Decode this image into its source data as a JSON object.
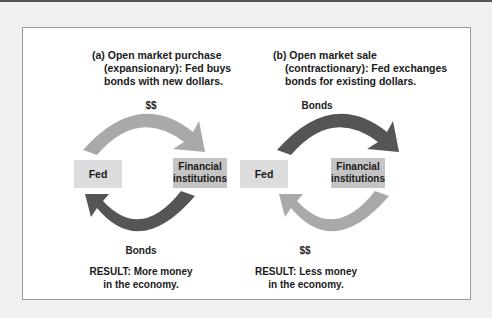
{
  "figure": {
    "panel_a": {
      "caption_line1": "(a) Open market purchase",
      "caption_line2": "(expansionary): Fed buys",
      "caption_line3": "bonds with new dollars.",
      "top_flow_label": "$$",
      "bottom_flow_label": "Bonds",
      "node_left": "Fed",
      "node_right_line1": "Financial",
      "node_right_line2": "institutions",
      "result_line1": "RESULT: More money",
      "result_line2": "in the economy.",
      "top_arrow_color": "#a9a9a9",
      "bottom_arrow_color": "#555555"
    },
    "panel_b": {
      "caption_line1": "(b) Open market sale",
      "caption_line2": "(contractionary): Fed exchanges",
      "caption_line3": "bonds for existing dollars.",
      "top_flow_label": "Bonds",
      "bottom_flow_label": "$$",
      "node_left": "Fed",
      "node_right_line1": "Financial",
      "node_right_line2": "institutions",
      "result_line1": "RESULT: Less money",
      "result_line2": "in the economy.",
      "top_arrow_color": "#555555",
      "bottom_arrow_color": "#a9a9a9"
    }
  }
}
